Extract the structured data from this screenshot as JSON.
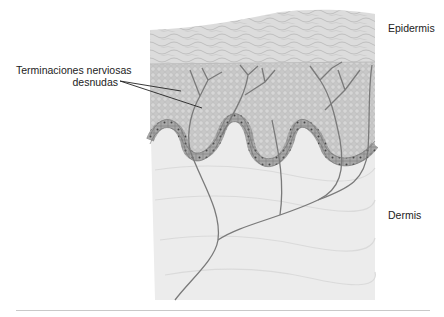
{
  "diagram": {
    "title": "",
    "labels": {
      "nerve_endings_line1": "Terminaciones nerviosas",
      "nerve_endings_line2": "desnudas",
      "epidermis": "Epidermis",
      "dermis": "Dermis"
    },
    "layers": [
      {
        "name": "stratum corneum",
        "color": "#d9d9d9"
      },
      {
        "name": "epidermis (granular)",
        "color": "#c4c4c4"
      },
      {
        "name": "basal layer",
        "color": "#9e9e9e"
      },
      {
        "name": "dermis",
        "color": "#ececec"
      }
    ],
    "colors": {
      "nerve": "#7a7a7a",
      "leader_line": "#222222",
      "text": "#222222",
      "divider": "#c9c9c9"
    }
  }
}
